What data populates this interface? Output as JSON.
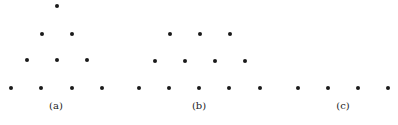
{
  "style": {
    "dot_color": "#1a1a1a",
    "label_color": "#222222"
  },
  "panels": [
    {
      "id": "a",
      "label": "(a)",
      "label_pos": [
        56,
        105
      ],
      "dots": [
        [
          57,
          6
        ],
        [
          42,
          34
        ],
        [
          72,
          34
        ],
        [
          27,
          60
        ],
        [
          57,
          60
        ],
        [
          87,
          60
        ],
        [
          11,
          88
        ],
        [
          41,
          88
        ],
        [
          72,
          88
        ],
        [
          102,
          88
        ]
      ]
    },
    {
      "id": "b",
      "label": "(b)",
      "label_pos": [
        199,
        105
      ],
      "dots": [
        [
          170,
          34
        ],
        [
          200,
          34
        ],
        [
          230,
          34
        ],
        [
          155,
          61
        ],
        [
          185,
          61
        ],
        [
          215,
          61
        ],
        [
          245,
          61
        ],
        [
          139,
          88
        ],
        [
          169,
          88
        ],
        [
          199,
          88
        ],
        [
          229,
          88
        ],
        [
          260,
          88
        ]
      ]
    },
    {
      "id": "c",
      "label": "(c)",
      "label_pos": [
        343,
        105
      ],
      "dots": [
        [
          298,
          88
        ],
        [
          328,
          88
        ],
        [
          358,
          88
        ],
        [
          388,
          88
        ]
      ]
    }
  ]
}
